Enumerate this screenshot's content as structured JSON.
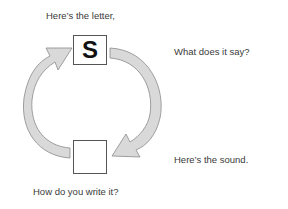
{
  "diagram": {
    "top_label": "Here’s the letter,",
    "right_top_label": "What does it say?",
    "right_bottom_label": "Here’s the sound.",
    "bottom_label": "How do you write it?",
    "top_box_letter": "S",
    "bottom_box_letter": "",
    "colors": {
      "arrow_fill": "#d9d9d9",
      "arrow_stroke": "#8a8a8a",
      "box_border": "#555555",
      "text": "#3a3a3a"
    }
  }
}
